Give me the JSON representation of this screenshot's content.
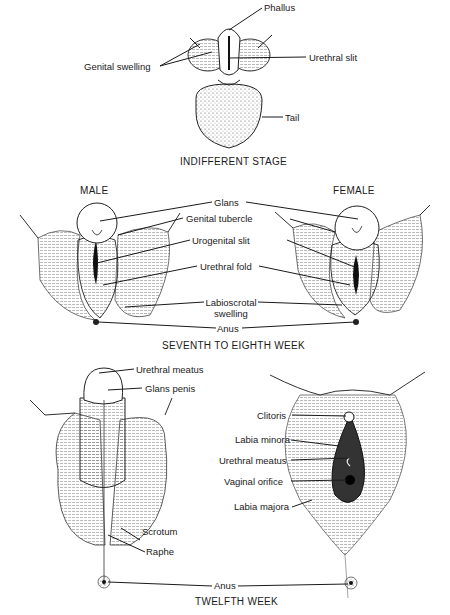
{
  "figure": {
    "sections": {
      "indifferent": {
        "caption": "INDIFFERENT STAGE",
        "labels": {
          "phallus": "Phallus",
          "genital_swelling": "Genital swelling",
          "urethral_slit": "Urethral slit",
          "tail": "Tail"
        }
      },
      "week7_8": {
        "caption": "SEVENTH TO EIGHTH WEEK",
        "male_heading": "MALE",
        "female_heading": "FEMALE",
        "labels": {
          "glans": "Glans",
          "genital_tubercle": "Genital tubercle",
          "urogenital_slit": "Urogenital slit",
          "urethral_fold": "Urethral fold",
          "labioscrotal_1": "Labioscrotal",
          "labioscrotal_2": "swelling",
          "anus": "Anus"
        }
      },
      "week12": {
        "caption": "TWELFTH WEEK",
        "male_labels": {
          "urethral_meatus": "Urethral meatus",
          "glans_penis": "Glans penis",
          "scrotum": "Scrotum",
          "raphe": "Raphe"
        },
        "female_labels": {
          "clitoris": "Clitoris",
          "labia_minora": "Labia minora",
          "urethral_meatus": "Urethral meatus",
          "vaginal_orifice": "Vaginal orifice",
          "labia_majora": "Labia majora"
        },
        "anus": "Anus"
      }
    }
  }
}
